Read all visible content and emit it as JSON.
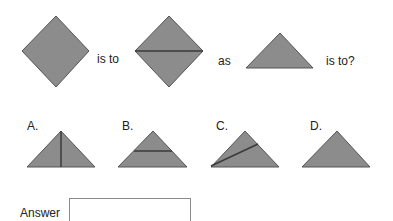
{
  "question": {
    "text_is_to": "is to",
    "text_as": "as",
    "text_is_to_q": "is to?",
    "shapes": [
      "diamond",
      "diamond-split-horizontal",
      "triangle"
    ]
  },
  "options": [
    {
      "label": "A.",
      "shape": "triangle-vertical-line"
    },
    {
      "label": "B.",
      "shape": "triangle-horizontal-line"
    },
    {
      "label": "C.",
      "shape": "triangle-diagonal-line"
    },
    {
      "label": "D.",
      "shape": "triangle-plain"
    }
  ],
  "answer": {
    "label": "Answer",
    "value": ""
  },
  "colors": {
    "fill": "#8c8c8c",
    "stroke": "#555555",
    "line": "#3a3a3a"
  }
}
